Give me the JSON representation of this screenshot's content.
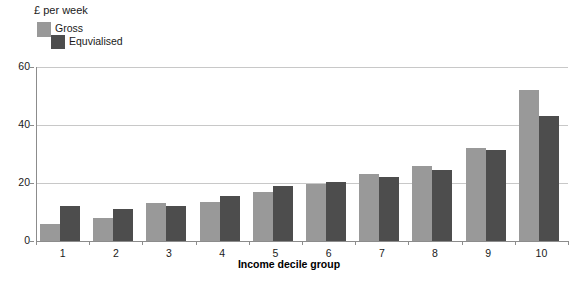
{
  "chart_data": {
    "type": "bar",
    "title": "£ per week",
    "xlabel": "Income decile group",
    "ylabel": "",
    "categories": [
      "1",
      "2",
      "3",
      "4",
      "5",
      "6",
      "7",
      "8",
      "9",
      "10"
    ],
    "series": [
      {
        "name": "Gross",
        "color": "#999999",
        "values": [
          6,
          8,
          13,
          13.5,
          17,
          19.5,
          23,
          26,
          32,
          52
        ]
      },
      {
        "name": "Equvialised",
        "color": "#4d4d4d",
        "values": [
          12,
          11,
          12,
          15.5,
          19,
          20.5,
          22,
          24.5,
          31.5,
          43
        ]
      }
    ],
    "ylim": [
      0,
      60
    ],
    "yticks": [
      0,
      20,
      40,
      60
    ],
    "ytick_labels": [
      "0",
      "20",
      "40",
      "60"
    ],
    "grid": true,
    "legend_position": "top-left",
    "axis_color": "#8c8c8c",
    "grid_color": "#c8c8c8",
    "background": "#ffffff"
  },
  "legend": {
    "items": [
      {
        "label": "Gross",
        "color": "#999999"
      },
      {
        "label": "Equvialised",
        "color": "#4d4d4d"
      }
    ]
  }
}
